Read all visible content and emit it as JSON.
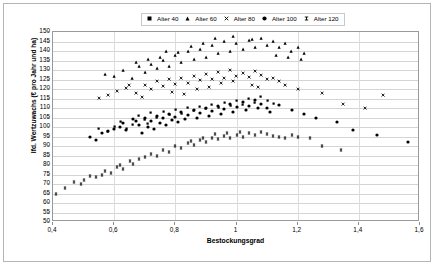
{
  "chart_data": {
    "type": "scatter",
    "title": "",
    "xlabel": "Bestockungsgrad",
    "ylabel": "lfd. Wertzuwachs (€ pro Jahr und ha)",
    "xlim": [
      0.4,
      1.6
    ],
    "ylim": [
      50,
      150
    ],
    "xticks": [
      "0,4",
      "0,6",
      "0,8",
      "1",
      "1,2",
      "1,4",
      "1,6"
    ],
    "xtick_values": [
      0.4,
      0.6,
      0.8,
      1.0,
      1.2,
      1.4,
      1.6
    ],
    "yticks": [
      "50",
      "55",
      "60",
      "65",
      "70",
      "75",
      "80",
      "85",
      "90",
      "95",
      "100",
      "105",
      "110",
      "115",
      "120",
      "125",
      "130",
      "135",
      "140",
      "145",
      "150"
    ],
    "ytick_values": [
      50,
      55,
      60,
      65,
      70,
      75,
      80,
      85,
      90,
      95,
      100,
      105,
      110,
      115,
      120,
      125,
      130,
      135,
      140,
      145,
      150
    ],
    "grid": "horizontal",
    "legend_position": "top-center",
    "marker_color": "#000000",
    "series": [
      {
        "name": "Alter 40",
        "marker": "square",
        "points": [
          [
            0.62,
            103.0
          ],
          [
            0.66,
            101.5
          ],
          [
            0.68,
            106.0
          ],
          [
            0.7,
            104.0
          ],
          [
            0.72,
            107.5
          ],
          [
            0.74,
            105.0
          ],
          [
            0.76,
            108.0
          ],
          [
            0.78,
            106.5
          ],
          [
            0.8,
            109.0
          ],
          [
            0.82,
            107.0
          ],
          [
            0.84,
            110.0
          ],
          [
            0.86,
            108.5
          ],
          [
            0.88,
            111.0
          ],
          [
            0.9,
            109.5
          ],
          [
            0.92,
            112.0
          ],
          [
            0.94,
            110.0
          ],
          [
            0.96,
            113.0
          ],
          [
            0.98,
            111.5
          ],
          [
            1.0,
            114.0
          ],
          [
            1.02,
            112.0
          ],
          [
            1.04,
            115.0
          ],
          [
            1.06,
            113.0
          ],
          [
            1.08,
            116.0
          ],
          [
            1.1,
            114.0
          ],
          [
            1.12,
            112.5
          ],
          [
            0.55,
            99.0
          ],
          [
            0.58,
            97.5
          ],
          [
            0.6,
            100.0
          ],
          [
            0.64,
            99.0
          ],
          [
            0.71,
            102.0
          ]
        ]
      },
      {
        "name": "Alter 60",
        "marker": "triangle",
        "points": [
          [
            0.57,
            128.0
          ],
          [
            0.6,
            127.0
          ],
          [
            0.63,
            130.0
          ],
          [
            0.66,
            126.0
          ],
          [
            0.68,
            132.0
          ],
          [
            0.7,
            129.0
          ],
          [
            0.72,
            133.0
          ],
          [
            0.74,
            131.0
          ],
          [
            0.76,
            135.0
          ],
          [
            0.78,
            132.0
          ],
          [
            0.8,
            138.0
          ],
          [
            0.82,
            134.0
          ],
          [
            0.84,
            140.0
          ],
          [
            0.86,
            136.0
          ],
          [
            0.88,
            141.0
          ],
          [
            0.9,
            137.0
          ],
          [
            0.92,
            143.0
          ],
          [
            0.94,
            139.0
          ],
          [
            0.96,
            145.0
          ],
          [
            0.98,
            140.0
          ],
          [
            1.0,
            144.0
          ],
          [
            1.02,
            141.0
          ],
          [
            1.04,
            146.0
          ],
          [
            1.06,
            142.0
          ],
          [
            1.08,
            147.0
          ],
          [
            1.1,
            143.0
          ],
          [
            1.12,
            145.0
          ],
          [
            1.14,
            142.0
          ],
          [
            1.16,
            144.0
          ],
          [
            1.18,
            140.0
          ],
          [
            1.2,
            142.0
          ],
          [
            1.22,
            139.0
          ],
          [
            0.93,
            147.0
          ],
          [
            0.99,
            148.0
          ],
          [
            1.05,
            146.5
          ],
          [
            0.85,
            142.5
          ],
          [
            0.89,
            144.0
          ],
          [
            1.13,
            138.0
          ],
          [
            1.17,
            137.0
          ],
          [
            1.21,
            136.0
          ],
          [
            0.75,
            137.0
          ],
          [
            0.81,
            139.5
          ],
          [
            0.67,
            134.0
          ],
          [
            0.71,
            136.0
          ],
          [
            0.77,
            140.0
          ]
        ]
      },
      {
        "name": "Alter 80",
        "marker": "cross",
        "points": [
          [
            0.55,
            115.0
          ],
          [
            0.58,
            117.0
          ],
          [
            0.61,
            119.0
          ],
          [
            0.64,
            120.5
          ],
          [
            0.67,
            118.0
          ],
          [
            0.7,
            122.0
          ],
          [
            0.72,
            120.0
          ],
          [
            0.74,
            124.0
          ],
          [
            0.76,
            121.5
          ],
          [
            0.78,
            125.0
          ],
          [
            0.8,
            122.5
          ],
          [
            0.82,
            126.0
          ],
          [
            0.84,
            123.0
          ],
          [
            0.86,
            127.0
          ],
          [
            0.88,
            124.5
          ],
          [
            0.9,
            128.0
          ],
          [
            0.92,
            125.5
          ],
          [
            0.94,
            129.0
          ],
          [
            0.96,
            126.0
          ],
          [
            0.98,
            130.0
          ],
          [
            1.0,
            127.0
          ],
          [
            1.02,
            128.5
          ],
          [
            1.04,
            126.5
          ],
          [
            1.06,
            129.5
          ],
          [
            1.08,
            127.5
          ],
          [
            1.1,
            125.0
          ],
          [
            1.12,
            126.0
          ],
          [
            1.14,
            124.0
          ],
          [
            1.16,
            122.0
          ],
          [
            1.2,
            120.0
          ],
          [
            1.28,
            118.0
          ],
          [
            1.35,
            112.0
          ],
          [
            1.42,
            110.0
          ],
          [
            1.48,
            117.0
          ],
          [
            0.65,
            122.0
          ],
          [
            0.69,
            116.0
          ],
          [
            0.87,
            120.0
          ],
          [
            0.95,
            123.0
          ],
          [
            1.05,
            122.0
          ],
          [
            0.79,
            118.5
          ],
          [
            0.83,
            117.5
          ],
          [
            0.91,
            121.0
          ],
          [
            0.99,
            124.0
          ],
          [
            1.07,
            121.0
          ]
        ]
      },
      {
        "name": "Alter 100",
        "marker": "circle",
        "points": [
          [
            0.52,
            95.0
          ],
          [
            0.56,
            97.0
          ],
          [
            0.6,
            99.0
          ],
          [
            0.63,
            102.0
          ],
          [
            0.66,
            104.0
          ],
          [
            0.68,
            101.0
          ],
          [
            0.7,
            105.0
          ],
          [
            0.72,
            103.0
          ],
          [
            0.74,
            106.0
          ],
          [
            0.76,
            104.5
          ],
          [
            0.78,
            107.0
          ],
          [
            0.8,
            105.5
          ],
          [
            0.82,
            108.0
          ],
          [
            0.84,
            106.5
          ],
          [
            0.86,
            109.0
          ],
          [
            0.88,
            107.5
          ],
          [
            0.9,
            110.0
          ],
          [
            0.92,
            108.5
          ],
          [
            0.94,
            111.0
          ],
          [
            0.96,
            109.5
          ],
          [
            0.98,
            112.0
          ],
          [
            1.0,
            110.5
          ],
          [
            1.02,
            113.0
          ],
          [
            1.04,
            111.0
          ],
          [
            1.06,
            114.0
          ],
          [
            1.08,
            112.0
          ],
          [
            1.1,
            110.0
          ],
          [
            1.14,
            111.5
          ],
          [
            1.18,
            109.0
          ],
          [
            1.22,
            107.0
          ],
          [
            1.26,
            105.0
          ],
          [
            1.33,
            102.5
          ],
          [
            1.38,
            98.5
          ],
          [
            1.46,
            96.0
          ],
          [
            1.56,
            92.0
          ],
          [
            0.58,
            98.0
          ],
          [
            0.62,
            100.0
          ],
          [
            0.64,
            98.5
          ],
          [
            0.67,
            103.0
          ],
          [
            0.71,
            100.0
          ],
          [
            0.75,
            102.0
          ],
          [
            0.79,
            103.5
          ],
          [
            0.83,
            104.0
          ],
          [
            0.87,
            105.0
          ],
          [
            0.91,
            106.0
          ],
          [
            0.95,
            107.0
          ],
          [
            0.99,
            108.0
          ],
          [
            1.03,
            109.0
          ],
          [
            1.07,
            110.0
          ],
          [
            1.11,
            108.0
          ],
          [
            0.54,
            93.0
          ],
          [
            0.69,
            97.0
          ],
          [
            0.73,
            99.0
          ],
          [
            0.77,
            101.0
          ],
          [
            0.81,
            102.5
          ]
        ]
      },
      {
        "name": "Alter 120",
        "marker": "dash",
        "points": [
          [
            0.41,
            65.0
          ],
          [
            0.44,
            68.0
          ],
          [
            0.47,
            71.0
          ],
          [
            0.49,
            70.0
          ],
          [
            0.52,
            74.0
          ],
          [
            0.54,
            73.5
          ],
          [
            0.57,
            77.0
          ],
          [
            0.59,
            76.0
          ],
          [
            0.61,
            79.0
          ],
          [
            0.63,
            78.0
          ],
          [
            0.65,
            82.0
          ],
          [
            0.66,
            80.5
          ],
          [
            0.68,
            83.0
          ],
          [
            0.7,
            84.0
          ],
          [
            0.72,
            86.0
          ],
          [
            0.74,
            85.0
          ],
          [
            0.76,
            88.0
          ],
          [
            0.78,
            87.0
          ],
          [
            0.8,
            90.0
          ],
          [
            0.82,
            89.0
          ],
          [
            0.84,
            91.5
          ],
          [
            0.86,
            90.5
          ],
          [
            0.88,
            93.0
          ],
          [
            0.9,
            92.0
          ],
          [
            0.92,
            94.0
          ],
          [
            0.94,
            93.5
          ],
          [
            0.96,
            95.5
          ],
          [
            0.98,
            94.5
          ],
          [
            1.0,
            96.0
          ],
          [
            1.02,
            95.0
          ],
          [
            1.04,
            97.0
          ],
          [
            1.06,
            96.0
          ],
          [
            1.08,
            97.5
          ],
          [
            1.1,
            96.5
          ],
          [
            1.12,
            95.5
          ],
          [
            1.14,
            95.0
          ],
          [
            1.16,
            94.0
          ],
          [
            1.18,
            96.0
          ],
          [
            1.2,
            95.0
          ],
          [
            1.24,
            94.0
          ],
          [
            1.28,
            90.0
          ],
          [
            1.34,
            88.0
          ],
          [
            0.5,
            72.0
          ],
          [
            0.56,
            75.0
          ],
          [
            0.62,
            80.0
          ],
          [
            0.85,
            92.5
          ],
          [
            0.89,
            94.5
          ],
          [
            0.93,
            96.5
          ],
          [
            0.97,
            97.0
          ],
          [
            1.01,
            97.5
          ]
        ]
      }
    ]
  },
  "legend": {
    "items": [
      {
        "label": "Alter 40",
        "marker": "square"
      },
      {
        "label": "Alter 60",
        "marker": "triangle"
      },
      {
        "label": "Alter 80",
        "marker": "cross"
      },
      {
        "label": "Alter 100",
        "marker": "circle"
      },
      {
        "label": "Alter 120",
        "marker": "dash"
      }
    ]
  }
}
